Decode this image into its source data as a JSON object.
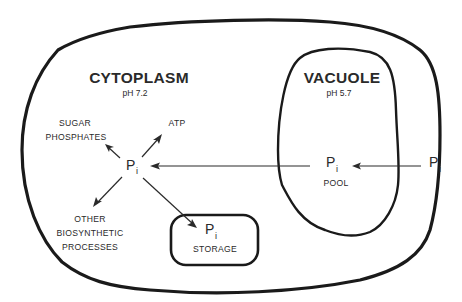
{
  "compartments": {
    "cytoplasm": {
      "name": "CYTOPLASM",
      "ph": "pH 7.2"
    },
    "vacuole": {
      "name": "VACUOLE",
      "ph": "pH 5.7"
    },
    "storage": {
      "label": "STORAGE"
    }
  },
  "nodes": {
    "central": {
      "symbol": "P",
      "subscript": "i"
    },
    "pool": {
      "symbol": "P",
      "subscript": "i",
      "label": "POOL"
    },
    "external": {
      "symbol": "P",
      "subscript": "i"
    },
    "storage": {
      "symbol": "P",
      "subscript": "i"
    }
  },
  "products": {
    "sugar_phosphates": {
      "line1": "SUGAR",
      "line2": "PHOSPHATES"
    },
    "atp": {
      "label": "ATP"
    },
    "other": {
      "line1": "OTHER",
      "line2": "BIOSYNTHETIC",
      "line3": "PROCESSES"
    }
  },
  "colors": {
    "ink": "#2a2a2a",
    "membrane": "#1a1a1a",
    "background": "#ffffff"
  }
}
